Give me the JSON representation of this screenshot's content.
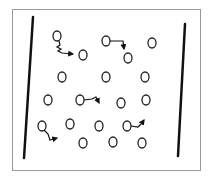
{
  "diagram": {
    "colors": {
      "background": "#ffffff",
      "frame": "#9a9a9a",
      "plate": "#111111",
      "particle": "#222222",
      "path": "#111111"
    },
    "plates": [
      {
        "id": "left-plate",
        "label": ""
      },
      {
        "id": "right-plate",
        "label": ""
      }
    ],
    "particle_count": 19,
    "moving_particle_count": 5,
    "paths": [
      {
        "id": "path-1",
        "style": "wavy",
        "direction": "down-right"
      },
      {
        "id": "path-2",
        "style": "bent",
        "direction": "right-then-down"
      },
      {
        "id": "path-3",
        "style": "bent",
        "direction": "right-then-down"
      },
      {
        "id": "path-4",
        "style": "bent",
        "direction": "down-then-right"
      },
      {
        "id": "path-5",
        "style": "bent",
        "direction": "right-then-up"
      }
    ]
  }
}
